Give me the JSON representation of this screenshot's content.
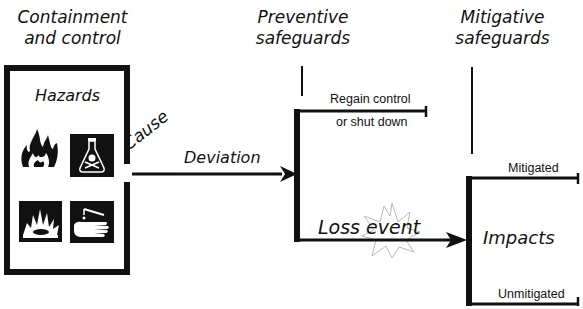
{
  "diagram": {
    "type": "bow-tie / hazard progression",
    "headers": {
      "containment": [
        "Containment",
        "and control"
      ],
      "preventive": [
        "Preventive",
        "safeguards"
      ],
      "mitigative": [
        "Mitigative",
        "safeguards"
      ]
    },
    "hazards_box": {
      "title": "Hazards",
      "icons": [
        "flame-icon",
        "toxic-flask-icon",
        "explosion-icon",
        "corrosive-hand-icon"
      ]
    },
    "labels": {
      "cause": "Cause",
      "deviation": "Deviation",
      "regain_line1": "Regain control",
      "regain_line2": "or shut down",
      "loss_event": "Loss event",
      "impacts": "Impacts",
      "mitigated": "Mitigated",
      "unmitigated": "Unmitigated"
    },
    "colors": {
      "line": "#111111",
      "starburst": "#b8b8b8",
      "background": "#ffffff"
    }
  }
}
